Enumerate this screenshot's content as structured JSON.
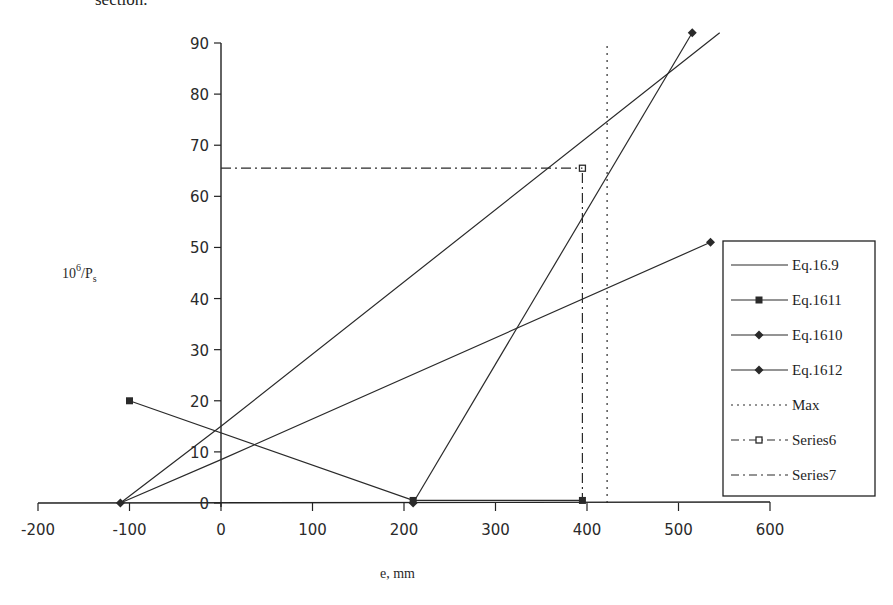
{
  "page": {
    "clipped_text_above": "section."
  },
  "chart_data": {
    "type": "line",
    "title": "",
    "xlabel": "e, mm",
    "ylabel": "10^6/P_s",
    "ylabel_parts": {
      "base": "10",
      "sup": "6",
      "mid": "/P",
      "sub": "s"
    },
    "xlim": [
      -200,
      600
    ],
    "ylim": [
      0,
      90
    ],
    "x_ticks": [
      -200,
      -100,
      0,
      100,
      200,
      300,
      400,
      500,
      600
    ],
    "y_ticks": [
      0,
      10,
      20,
      30,
      40,
      50,
      60,
      70,
      80,
      90
    ],
    "x_tick_labels": [
      "-200",
      "-100",
      "0",
      "100",
      "200",
      "300",
      "400",
      "500",
      "600"
    ],
    "y_tick_labels": [
      "0",
      "10",
      "20",
      "30",
      "40",
      "50",
      "60",
      "70",
      "80",
      "90"
    ],
    "grid": false,
    "legend_position": "right",
    "series": [
      {
        "name": "Eq.16.9",
        "style": "solid",
        "marker": "none",
        "points": [
          [
            -110,
            0
          ],
          [
            0,
            15
          ],
          [
            545,
            92
          ]
        ]
      },
      {
        "name": "Eq.1611",
        "style": "solid",
        "marker": "square",
        "points": [
          [
            -100,
            20
          ],
          [
            210,
            0.5
          ],
          [
            395,
            0.5
          ]
        ]
      },
      {
        "name": "Eq.1610",
        "style": "solid",
        "marker": "diamond",
        "points": [
          [
            -110,
            0
          ],
          [
            0,
            8.5
          ],
          [
            535,
            51
          ]
        ]
      },
      {
        "name": "Eq.1612",
        "style": "solid",
        "marker": "diamond",
        "points": [
          [
            210,
            0
          ],
          [
            515,
            92
          ]
        ]
      },
      {
        "name": "Max",
        "style": "dotted",
        "marker": "none",
        "points": [
          [
            422,
            0
          ],
          [
            422,
            90
          ]
        ]
      },
      {
        "name": "Series6",
        "style": "dash-dot",
        "marker": "open-square",
        "points": [
          [
            395,
            0
          ],
          [
            395,
            65.5
          ]
        ]
      },
      {
        "name": "Series7",
        "style": "dash-dot",
        "marker": "none",
        "points": [
          [
            0,
            65.5
          ],
          [
            395,
            65.5
          ]
        ]
      }
    ]
  },
  "legend": {
    "items": [
      {
        "label": "Eq.16.9",
        "style": "solid",
        "marker": "none"
      },
      {
        "label": "Eq.1611",
        "style": "solid",
        "marker": "square"
      },
      {
        "label": "Eq.1610",
        "style": "solid",
        "marker": "diamond"
      },
      {
        "label": "Eq.1612",
        "style": "solid",
        "marker": "diamond"
      },
      {
        "label": "Max",
        "style": "dotted",
        "marker": "none"
      },
      {
        "label": "Series6",
        "style": "dash-dot",
        "marker": "open-square"
      },
      {
        "label": "Series7",
        "style": "dash-dot",
        "marker": "none"
      }
    ]
  },
  "colors": {
    "line": "#2a2a2a",
    "axis": "#222222",
    "background": "#ffffff"
  }
}
